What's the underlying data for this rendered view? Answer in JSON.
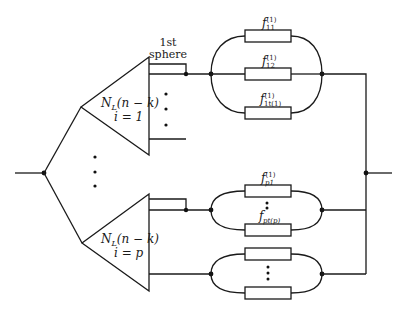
{
  "diagram": {
    "type": "reliability-network",
    "annotations": {
      "first_sphere_line1": "1st",
      "first_sphere_line2": "sphere"
    },
    "blocks": [
      {
        "id": "block-1",
        "label_main": "N",
        "label_sub": "L",
        "label_args": "(n − k)",
        "label_index": "i = 1"
      },
      {
        "id": "block-p",
        "label_main": "N",
        "label_sub": "L",
        "label_args": "(n − k)",
        "label_index": "i = p"
      }
    ],
    "groups": [
      {
        "id": "group-1",
        "elements": [
          {
            "label": "f",
            "sub": "11",
            "sup": "(1)"
          },
          {
            "label": "f",
            "sub": "12",
            "sup": "(1)"
          },
          {
            "label": "f",
            "sub": "1t(1)",
            "sup": "(1)"
          }
        ]
      },
      {
        "id": "group-p",
        "elements": [
          {
            "label": "f",
            "sub": "p1",
            "sup": "(1)"
          },
          {
            "label": "f",
            "sub": "pt(p)",
            "sup": ""
          }
        ]
      },
      {
        "id": "group-extra",
        "elements": [
          {
            "label": "",
            "sub": "",
            "sup": ""
          },
          {
            "label": "",
            "sub": "",
            "sup": ""
          }
        ]
      }
    ],
    "colors": {
      "line": "#1a1a1a",
      "background": "#ffffff"
    }
  }
}
